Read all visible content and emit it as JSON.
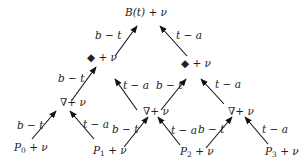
{
  "diagram": {
    "root": {
      "label": "B(t) + ν",
      "x": 125,
      "y": 7
    },
    "level1": [
      {
        "symbol": "◆",
        "label": "◆ + ν",
        "x": 87,
        "y": 52
      },
      {
        "symbol": "◆",
        "label": "◆ + ν",
        "x": 181,
        "y": 58
      }
    ],
    "level2": [
      {
        "symbol": "∇",
        "label": "∇+ ν",
        "x": 60,
        "y": 97
      },
      {
        "symbol": "∇",
        "label": "∇+ ν",
        "x": 143,
        "y": 106
      },
      {
        "symbol": "∇",
        "label": "∇+ ν",
        "x": 228,
        "y": 106
      }
    ],
    "leaves": [
      {
        "base": "P",
        "sub": "0",
        "suffix": " + ν",
        "x": 14,
        "y": 142
      },
      {
        "base": "P",
        "sub": "1",
        "suffix": " + ν",
        "x": 93,
        "y": 145
      },
      {
        "base": "P",
        "sub": "2",
        "suffix": " + ν",
        "x": 180,
        "y": 146
      },
      {
        "base": "P",
        "sub": "3",
        "suffix": " + ν",
        "x": 265,
        "y": 146
      }
    ],
    "edge_labels": [
      {
        "text": "b − t",
        "x": 95,
        "y": 30
      },
      {
        "text": "t − a",
        "x": 176,
        "y": 30
      },
      {
        "text": "b − t",
        "x": 58,
        "y": 73
      },
      {
        "text": "t − a",
        "x": 123,
        "y": 80
      },
      {
        "text": "b − t",
        "x": 156,
        "y": 80
      },
      {
        "text": "t − a",
        "x": 215,
        "y": 79
      },
      {
        "text": "b − t",
        "x": 17,
        "y": 120
      },
      {
        "text": "t − a",
        "x": 83,
        "y": 119
      },
      {
        "text": "b − t",
        "x": 112,
        "y": 124
      },
      {
        "text": "t − a",
        "x": 171,
        "y": 125
      },
      {
        "text": "b − t",
        "x": 198,
        "y": 124
      },
      {
        "text": "t − a",
        "x": 262,
        "y": 124
      }
    ],
    "arrows": [
      {
        "from": [
          115,
          56
        ],
        "to": [
          137,
          26
        ]
      },
      {
        "from": [
          187,
          56
        ],
        "to": [
          160,
          26
        ]
      },
      {
        "from": [
          72,
          100
        ],
        "to": [
          96,
          67
        ]
      },
      {
        "from": [
          137,
          110
        ],
        "to": [
          115,
          79
        ]
      },
      {
        "from": [
          161,
          110
        ],
        "to": [
          186,
          79
        ]
      },
      {
        "from": [
          224,
          104
        ],
        "to": [
          201,
          79
        ]
      },
      {
        "from": [
          32,
          139
        ],
        "to": [
          56,
          111
        ]
      },
      {
        "from": [
          94,
          139
        ],
        "to": [
          70,
          111
        ]
      },
      {
        "from": [
          124,
          147
        ],
        "to": [
          148,
          117
        ]
      },
      {
        "from": [
          180,
          145
        ],
        "to": [
          158,
          117
        ]
      },
      {
        "from": [
          206,
          148
        ],
        "to": [
          232,
          117
        ]
      },
      {
        "from": [
          268,
          144
        ],
        "to": [
          245,
          117
        ]
      }
    ]
  }
}
